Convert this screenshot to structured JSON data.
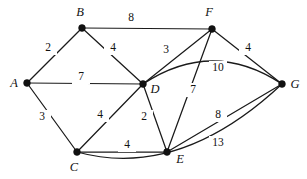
{
  "figure": {
    "name": "weighted-undirected-graph",
    "background_color": "#ffffff",
    "stroke_color": "#1a1a1a",
    "width": 307,
    "height": 179
  },
  "chart_data": {
    "type": "diagram",
    "graph_type": "weighted undirected graph",
    "title": "",
    "xlabel": "",
    "ylabel": "",
    "vertices": [
      {
        "id": "A",
        "label": "A",
        "x": 27,
        "y": 83,
        "label_x": 14,
        "label_y": 84
      },
      {
        "id": "B",
        "label": "B",
        "x": 82,
        "y": 28,
        "label_x": 80,
        "label_y": 13
      },
      {
        "id": "C",
        "label": "C",
        "x": 77,
        "y": 152,
        "label_x": 74,
        "label_y": 168
      },
      {
        "id": "D",
        "label": "D",
        "x": 143,
        "y": 84,
        "label_x": 155,
        "label_y": 90
      },
      {
        "id": "E",
        "label": "E",
        "x": 167,
        "y": 152,
        "label_x": 180,
        "label_y": 160
      },
      {
        "id": "F",
        "label": "F",
        "x": 212,
        "y": 29,
        "label_x": 209,
        "label_y": 13
      },
      {
        "id": "G",
        "label": "G",
        "x": 282,
        "y": 84,
        "label_x": 295,
        "label_y": 85
      }
    ],
    "edges": [
      {
        "from": "A",
        "to": "B",
        "weight": 2,
        "label_x": 48,
        "label_y": 48,
        "curved": false
      },
      {
        "from": "B",
        "to": "F",
        "weight": 8,
        "label_x": 131,
        "label_y": 18,
        "curved": false
      },
      {
        "from": "B",
        "to": "D",
        "weight": 4,
        "label_x": 113,
        "label_y": 48,
        "curved": false
      },
      {
        "from": "A",
        "to": "D",
        "weight": 7,
        "label_x": 81,
        "label_y": 77,
        "curved": false
      },
      {
        "from": "A",
        "to": "C",
        "weight": 3,
        "label_x": 42,
        "label_y": 117,
        "curved": false
      },
      {
        "from": "C",
        "to": "D",
        "weight": 4,
        "label_x": 100,
        "label_y": 115,
        "curved": false
      },
      {
        "from": "D",
        "to": "E",
        "weight": 2,
        "label_x": 144,
        "label_y": 117,
        "curved": false
      },
      {
        "from": "C",
        "to": "E",
        "weight": 4,
        "label_x": 127,
        "label_y": 145,
        "curved": false
      },
      {
        "from": "D",
        "to": "F",
        "weight": 3,
        "label_x": 166,
        "label_y": 50,
        "curved": false
      },
      {
        "from": "F",
        "to": "G",
        "weight": 4,
        "label_x": 248,
        "label_y": 48,
        "curved": false
      },
      {
        "from": "E",
        "to": "F",
        "weight": 7,
        "label_x": 193,
        "label_y": 90,
        "curved": false
      },
      {
        "from": "D",
        "to": "G",
        "weight": 10,
        "label_x": 218,
        "label_y": 68,
        "curved": true,
        "curve": "up"
      },
      {
        "from": "E",
        "to": "G",
        "weight": 8,
        "label_x": 218,
        "label_y": 115,
        "curved": false
      },
      {
        "from": "C",
        "to": "G",
        "weight": 13,
        "label_x": 218,
        "label_y": 143,
        "curved": true,
        "curve": "down"
      }
    ],
    "edge_count": 14,
    "vertex_count": 7
  }
}
